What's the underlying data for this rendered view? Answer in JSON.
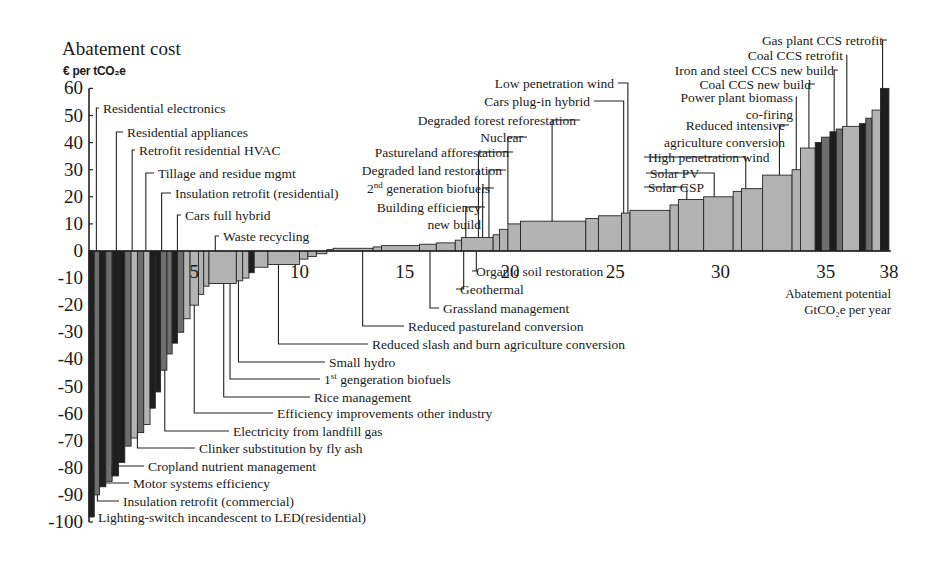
{
  "chart_data": {
    "type": "bar",
    "subtype": "marginal-abatement-cost-curve (variable-width bars)",
    "title": "Abatement cost",
    "ylabel": "€ per tCO2e",
    "xlabel": "Abatement potential GtCO2e per year",
    "xlabel_lines": [
      "Abatement potential",
      "GtCO2e per year"
    ],
    "ylim": [
      -100,
      60
    ],
    "xlim": [
      0,
      38
    ],
    "yticks": [
      60,
      50,
      40,
      30,
      20,
      10,
      0,
      -10,
      -20,
      -30,
      -40,
      -50,
      -60,
      -70,
      -80,
      -90,
      -100
    ],
    "xticks": [
      5,
      10,
      15,
      20,
      25,
      30,
      35,
      38
    ],
    "grid": false,
    "legend": "none (leader-line annotations)",
    "bars": [
      {
        "x0": 0.0,
        "x1": 0.25,
        "y": -98,
        "shade": "dark"
      },
      {
        "x0": 0.25,
        "x1": 0.5,
        "y": -90,
        "shade": "mid"
      },
      {
        "x0": 0.5,
        "x1": 0.8,
        "y": -87,
        "shade": "dark"
      },
      {
        "x0": 0.8,
        "x1": 1.1,
        "y": -85,
        "shade": "mid"
      },
      {
        "x0": 1.1,
        "x1": 1.4,
        "y": -83,
        "shade": "dark"
      },
      {
        "x0": 1.4,
        "x1": 1.7,
        "y": -78,
        "shade": "dark"
      },
      {
        "x0": 1.7,
        "x1": 2.0,
        "y": -72,
        "shade": "mid"
      },
      {
        "x0": 2.0,
        "x1": 2.3,
        "y": -69,
        "shade": "light"
      },
      {
        "x0": 2.3,
        "x1": 2.6,
        "y": -67,
        "shade": "mid"
      },
      {
        "x0": 2.6,
        "x1": 2.9,
        "y": -64,
        "shade": "light"
      },
      {
        "x0": 2.9,
        "x1": 3.15,
        "y": -58,
        "shade": "dark"
      },
      {
        "x0": 3.15,
        "x1": 3.4,
        "y": -52,
        "shade": "dark"
      },
      {
        "x0": 3.4,
        "x1": 3.7,
        "y": -44,
        "shade": "mid"
      },
      {
        "x0": 3.7,
        "x1": 3.95,
        "y": -38,
        "shade": "mid"
      },
      {
        "x0": 3.95,
        "x1": 4.2,
        "y": -34,
        "shade": "dark"
      },
      {
        "x0": 4.2,
        "x1": 4.5,
        "y": -30,
        "shade": "mid"
      },
      {
        "x0": 4.5,
        "x1": 4.8,
        "y": -25,
        "shade": "light"
      },
      {
        "x0": 4.8,
        "x1": 5.2,
        "y": -20,
        "shade": "light"
      },
      {
        "x0": 5.2,
        "x1": 5.45,
        "y": -16,
        "shade": "light"
      },
      {
        "x0": 5.45,
        "x1": 5.7,
        "y": -13,
        "shade": "light"
      },
      {
        "x0": 5.7,
        "x1": 7.0,
        "y": -12,
        "shade": "light"
      },
      {
        "x0": 7.0,
        "x1": 7.3,
        "y": -11,
        "shade": "light"
      },
      {
        "x0": 7.3,
        "x1": 7.6,
        "y": -10,
        "shade": "light"
      },
      {
        "x0": 7.6,
        "x1": 7.85,
        "y": -8,
        "shade": "dark"
      },
      {
        "x0": 7.85,
        "x1": 8.5,
        "y": -6,
        "shade": "light"
      },
      {
        "x0": 8.5,
        "x1": 10.0,
        "y": -5,
        "shade": "light"
      },
      {
        "x0": 10.0,
        "x1": 10.4,
        "y": -3,
        "shade": "light"
      },
      {
        "x0": 10.4,
        "x1": 10.8,
        "y": -2,
        "shade": "light"
      },
      {
        "x0": 10.8,
        "x1": 11.3,
        "y": -1,
        "shade": "light"
      },
      {
        "x0": 11.3,
        "x1": 11.6,
        "y": 0.5,
        "shade": "light"
      },
      {
        "x0": 11.6,
        "x1": 13.5,
        "y": 1,
        "shade": "light"
      },
      {
        "x0": 13.5,
        "x1": 13.9,
        "y": 1.5,
        "shade": "light"
      },
      {
        "x0": 13.9,
        "x1": 15.7,
        "y": 2,
        "shade": "light"
      },
      {
        "x0": 15.7,
        "x1": 16.5,
        "y": 2.5,
        "shade": "light"
      },
      {
        "x0": 16.5,
        "x1": 17.4,
        "y": 3,
        "shade": "light"
      },
      {
        "x0": 17.4,
        "x1": 17.7,
        "y": 4,
        "shade": "light"
      },
      {
        "x0": 17.7,
        "x1": 19.2,
        "y": 5,
        "shade": "light"
      },
      {
        "x0": 19.2,
        "x1": 19.5,
        "y": 6,
        "shade": "light"
      },
      {
        "x0": 19.5,
        "x1": 19.9,
        "y": 8,
        "shade": "light"
      },
      {
        "x0": 19.9,
        "x1": 20.5,
        "y": 10,
        "shade": "light"
      },
      {
        "x0": 20.5,
        "x1": 23.6,
        "y": 11,
        "shade": "light"
      },
      {
        "x0": 23.6,
        "x1": 24.2,
        "y": 12,
        "shade": "light"
      },
      {
        "x0": 24.2,
        "x1": 25.3,
        "y": 13,
        "shade": "light"
      },
      {
        "x0": 25.3,
        "x1": 25.7,
        "y": 14,
        "shade": "light"
      },
      {
        "x0": 25.7,
        "x1": 27.6,
        "y": 15,
        "shade": "light"
      },
      {
        "x0": 27.6,
        "x1": 28.0,
        "y": 17,
        "shade": "light"
      },
      {
        "x0": 28.0,
        "x1": 29.2,
        "y": 19,
        "shade": "light"
      },
      {
        "x0": 29.2,
        "x1": 30.6,
        "y": 20,
        "shade": "light"
      },
      {
        "x0": 30.6,
        "x1": 31.0,
        "y": 22,
        "shade": "light"
      },
      {
        "x0": 31.0,
        "x1": 32.0,
        "y": 23,
        "shade": "light"
      },
      {
        "x0": 32.0,
        "x1": 33.4,
        "y": 28,
        "shade": "light"
      },
      {
        "x0": 33.4,
        "x1": 33.8,
        "y": 30,
        "shade": "light"
      },
      {
        "x0": 33.8,
        "x1": 34.5,
        "y": 38,
        "shade": "light"
      },
      {
        "x0": 34.5,
        "x1": 34.8,
        "y": 40,
        "shade": "dark"
      },
      {
        "x0": 34.8,
        "x1": 35.2,
        "y": 42,
        "shade": "mid"
      },
      {
        "x0": 35.2,
        "x1": 35.5,
        "y": 44,
        "shade": "dark"
      },
      {
        "x0": 35.5,
        "x1": 35.8,
        "y": 45,
        "shade": "mid"
      },
      {
        "x0": 35.8,
        "x1": 36.6,
        "y": 46,
        "shade": "light"
      },
      {
        "x0": 36.6,
        "x1": 36.9,
        "y": 47,
        "shade": "dark"
      },
      {
        "x0": 36.9,
        "x1": 37.2,
        "y": 49,
        "shade": "mid"
      },
      {
        "x0": 37.2,
        "x1": 37.6,
        "y": 52,
        "shade": "light"
      },
      {
        "x0": 37.6,
        "x1": 38.0,
        "y": 60,
        "shade": "dark"
      }
    ],
    "annotations": [
      {
        "label": "Residential electronics",
        "x": 0.35,
        "y": 50,
        "lx": 103,
        "ly": 113,
        "anchor": "start"
      },
      {
        "label": "Residential appliances",
        "x": 1.3,
        "y": 42,
        "lx": 127,
        "ly": 137,
        "anchor": "start"
      },
      {
        "label": "Retrofit residential HVAC",
        "x": 2.05,
        "y": 35,
        "lx": 139,
        "ly": 155,
        "anchor": "start"
      },
      {
        "label": "Tillage and residue mgmt",
        "x": 2.7,
        "y": 29,
        "lx": 158,
        "ly": 178,
        "anchor": "start"
      },
      {
        "label": "Insulation retrofit (residential)",
        "x": 3.45,
        "y": 22,
        "lx": 175,
        "ly": 198,
        "anchor": "start"
      },
      {
        "label": "Cars full hybrid",
        "x": 4.2,
        "y": 15,
        "lx": 185,
        "ly": 220,
        "anchor": "start"
      },
      {
        "label": "Waste recycling",
        "x": 6.0,
        "y": 6,
        "lx": 223,
        "ly": 241,
        "anchor": "start"
      },
      {
        "label": "Low penetration wind",
        "x": 25.6,
        "y": 64,
        "lx": 614,
        "ly": 88,
        "anchor": "end"
      },
      {
        "label": "Cars plug-in hybrid",
        "x": 25.4,
        "y": 58,
        "lx": 590,
        "ly": 106,
        "anchor": "end"
      },
      {
        "label": "Degraded forest reforestation",
        "x": 22.0,
        "y": 52,
        "lx": 576,
        "ly": 125,
        "anchor": "end"
      },
      {
        "label": "Nuclear",
        "x": 19.9,
        "y": 49,
        "lx": 523,
        "ly": 142,
        "anchor": "end"
      },
      {
        "label": "Pastureland afforestation",
        "x": 18.5,
        "y": 44,
        "lx": 509,
        "ly": 157,
        "anchor": "end"
      },
      {
        "label": "Degraded land restoration",
        "x": 19.0,
        "y": 38,
        "lx": 502,
        "ly": 175,
        "anchor": "end"
      },
      {
        "label": "2nd generation biofuels",
        "x": 18.7,
        "y": 32,
        "lx": 490,
        "ly": 193,
        "anchor": "end",
        "superscript": "nd"
      },
      {
        "label": "Building efficiency new build",
        "lines": [
          "Building efficiency",
          "new build"
        ],
        "x": 17.9,
        "y": 24,
        "lx": 481,
        "ly": 212,
        "anchor": "end"
      },
      {
        "label": "Solar CSP",
        "x": 28.4,
        "y": 16,
        "lx": 648,
        "ly": 192,
        "anchor": "start"
      },
      {
        "label": "Solar PV",
        "x": 29.7,
        "y": 27,
        "lx": 650,
        "ly": 178,
        "anchor": "start"
      },
      {
        "label": "High penetration wind",
        "x": 31.2,
        "y": 33,
        "lx": 648,
        "ly": 162,
        "anchor": "start"
      },
      {
        "label": "Reduced intensive agriculture conversion",
        "lines": [
          "Reduced intensive",
          "agriculture conversion"
        ],
        "x": 32.8,
        "y": 42,
        "lx": 785,
        "ly": 130,
        "anchor": "end"
      },
      {
        "label": "Power plant biomass co-firing",
        "lines": [
          "Power plant biomass",
          "co-firing"
        ],
        "x": 33.6,
        "y": 54,
        "lx": 793,
        "ly": 102,
        "anchor": "end"
      },
      {
        "label": "Coal CCS new build",
        "x": 34.2,
        "y": 61,
        "lx": 811,
        "ly": 89,
        "anchor": "end"
      },
      {
        "label": "Iron and steel CCS new build",
        "x": 35.4,
        "y": 67,
        "lx": 834,
        "ly": 75,
        "anchor": "end"
      },
      {
        "label": "Coal CCS retrofit",
        "x": 36.0,
        "y": 75,
        "lx": 843,
        "ly": 60,
        "anchor": "end"
      },
      {
        "label": "Gas plant CCS retrofit",
        "x": 37.7,
        "y": 82,
        "lx": 883,
        "ly": 45,
        "anchor": "end"
      },
      {
        "label": "Organic soil restoration",
        "x": 18.4,
        "y": -5,
        "lx": 476,
        "ly": 276,
        "anchor": "start"
      },
      {
        "label": "Geothermal",
        "x": 17.8,
        "y": -11,
        "lx": 460,
        "ly": 294,
        "anchor": "start"
      },
      {
        "label": "Grassland management",
        "x": 16.2,
        "y": -17,
        "lx": 443,
        "ly": 313,
        "anchor": "start"
      },
      {
        "label": "Reduced pastureland conversion",
        "x": 13.0,
        "y": -23,
        "lx": 408,
        "ly": 331,
        "anchor": "start"
      },
      {
        "label": "Reduced slash and burn agriculture conversion",
        "x": 9.0,
        "y": -30,
        "lx": 372,
        "ly": 349,
        "anchor": "start"
      },
      {
        "label": "Small hydro",
        "x": 7.1,
        "y": -36,
        "lx": 329,
        "ly": 367,
        "anchor": "start"
      },
      {
        "label": "1st gengeration biofuels",
        "x": 6.7,
        "y": -42,
        "lx": 324,
        "ly": 384,
        "anchor": "start",
        "superscript": "st"
      },
      {
        "label": "Rice management",
        "x": 6.4,
        "y": -49,
        "lx": 314,
        "ly": 402,
        "anchor": "start"
      },
      {
        "label": "Efficiency improvements other industry",
        "x": 5.0,
        "y": -55,
        "lx": 277,
        "ly": 418,
        "anchor": "start"
      },
      {
        "label": "Electricity from landfill gas",
        "x": 3.6,
        "y": -61,
        "lx": 233,
        "ly": 436,
        "anchor": "start"
      },
      {
        "label": "Clinker substitution by fly ash",
        "x": 2.3,
        "y": -68,
        "lx": 199,
        "ly": 453,
        "anchor": "start"
      },
      {
        "label": "Cropland nutrient management",
        "x": 1.1,
        "y": -75,
        "lx": 148,
        "ly": 471,
        "anchor": "start"
      },
      {
        "label": "Motor systems efficiency",
        "x": 0.65,
        "y": -81,
        "lx": 133,
        "ly": 488,
        "anchor": "start"
      },
      {
        "label": "Insulation retrofit (commercial)",
        "x": 0.4,
        "y": -87,
        "lx": 123,
        "ly": 506,
        "anchor": "start"
      },
      {
        "label": "Lighting-switch incandescent to LED(residential)",
        "x": 0.05,
        "y": -96,
        "lx": 98,
        "ly": 522,
        "anchor": "start"
      }
    ]
  },
  "header": {
    "title": "Abatement cost",
    "unit": "€ per tCO₂e"
  },
  "x_axis_label": {
    "line1": "Abatement potential",
    "line2": "GtCO₂e per year"
  },
  "colors": {
    "dark": "#1e1e1e",
    "mid": "#6e6e6e",
    "light": "#b3b3b3",
    "outline": "#262626",
    "axis": "#222222",
    "text": "#1a1a1a"
  },
  "geometry": {
    "x0_px": 89,
    "px_per_gt": 21.05,
    "y0_px": 251,
    "px_per_eur": 2.71
  }
}
